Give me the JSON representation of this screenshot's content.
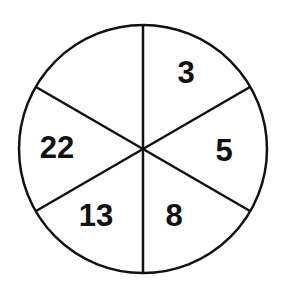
{
  "diagram": {
    "type": "number-wheel",
    "sector_count": 6,
    "sectors": [
      {
        "position": "top-right",
        "label": "3"
      },
      {
        "position": "right",
        "label": "5"
      },
      {
        "position": "bottom-right",
        "label": "8"
      },
      {
        "position": "bottom-left",
        "label": "13"
      },
      {
        "position": "left",
        "label": "22"
      },
      {
        "position": "top-left",
        "label": ""
      }
    ],
    "colors": {
      "stroke": "#111111",
      "fill": "#ffffff",
      "text": "#111111"
    }
  }
}
